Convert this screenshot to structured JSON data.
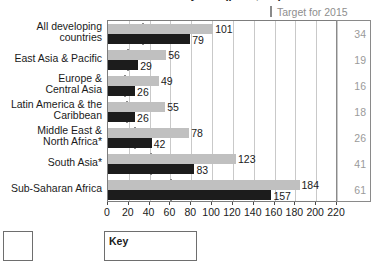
{
  "chart_title": "Under-five mortality rate (per 1,000)",
  "target_header": {
    "marker_icon": "target-tick-icon",
    "label": "Target for 2015"
  },
  "key_box": {
    "label": "Key"
  },
  "colors": {
    "current_bar": "#c0c0c0",
    "target_bar": "#1c1c1c",
    "target_marker": "#8a8a8a",
    "target_text": "#9a9a9a",
    "gridline": "#c9c9c9",
    "axis": "#7d7d7d"
  },
  "chart_data": {
    "type": "bar",
    "orientation": "horizontal",
    "title": "Under-five mortality rate (per 1,000)",
    "xlabel": "",
    "ylabel": "",
    "xlim": [
      0,
      220
    ],
    "xticks": [
      0,
      20,
      40,
      60,
      80,
      100,
      120,
      140,
      160,
      180,
      200,
      220
    ],
    "grid": true,
    "legend_position": "below",
    "categories": [
      "All developing\ncountries",
      "East Asia & Pacific",
      "Europe &\nCentral Asia",
      "Latin America & the\nCaribbean",
      "Middle East &\nNorth Africa*",
      "South Asia*",
      "Sub-Saharan Africa"
    ],
    "series": [
      {
        "name": "1990",
        "color": "#c0c0c0",
        "values": [
          101,
          56,
          49,
          55,
          78,
          123,
          184
        ]
      },
      {
        "name": "Latest",
        "color": "#1c1c1c",
        "values": [
          79,
          29,
          26,
          26,
          42,
          83,
          157
        ]
      }
    ],
    "target_markers": {
      "name": "Target for 2015",
      "color": "#8a8a8a",
      "values": [
        34,
        19,
        16,
        18,
        26,
        41,
        61
      ]
    },
    "target_column": {
      "header": "Target for 2015",
      "values": [
        "34",
        "19",
        "16",
        "18",
        "26",
        "41",
        "61"
      ]
    },
    "bar_labels": {
      "series1": [
        "101",
        "56",
        "49",
        "55",
        "78",
        "123",
        "184"
      ],
      "series2": [
        "79",
        "29",
        "26",
        "26",
        "42",
        "83",
        "157"
      ]
    },
    "xtick_labels": [
      "0",
      "20",
      "40",
      "60",
      "80",
      "100",
      "120",
      "140",
      "160",
      "180",
      "200",
      "220"
    ]
  }
}
